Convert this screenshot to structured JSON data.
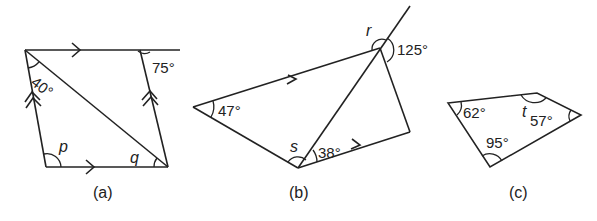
{
  "figures": [
    {
      "id": "a",
      "caption": "(a)",
      "shape": "parallelogram with diagonal",
      "angles": {
        "top_left_diagonal": "40°",
        "top_right_exterior": "75°"
      },
      "unknowns": {
        "bottom_left": "p",
        "bottom_right": "q"
      }
    },
    {
      "id": "b",
      "caption": "(b)",
      "shape": "quadrilateral with diagonal and extended line",
      "angles": {
        "left_vertex": "47°",
        "bottom_right_of_diagonal": "38°",
        "top_exterior": "125°"
      },
      "unknowns": {
        "top_vertex": "r",
        "bottom_vertex": "s"
      }
    },
    {
      "id": "c",
      "caption": "(c)",
      "shape": "quadrilateral",
      "angles": {
        "left_vertex": "62°",
        "bottom_vertex": "95°",
        "right_vertex": "57°"
      },
      "unknowns": {
        "top_right_vertex": "t"
      }
    }
  ]
}
